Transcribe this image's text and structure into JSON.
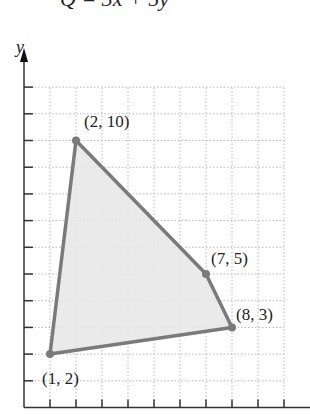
{
  "header": {
    "formula_cropped": "Q = 3x + 5y"
  },
  "chart_data": {
    "type": "polygon",
    "title": "",
    "xlabel": "",
    "ylabel": "y",
    "xlim": [
      0,
      10
    ],
    "ylim": [
      0,
      12
    ],
    "grid": true,
    "x_ticks": [
      1,
      2,
      3,
      4,
      5,
      6,
      7,
      8,
      9,
      10
    ],
    "y_ticks": [
      1,
      2,
      3,
      4,
      5,
      6,
      7,
      8,
      9,
      10,
      11,
      12
    ],
    "vertices": [
      {
        "x": 1,
        "y": 2,
        "label": "(1, 2)"
      },
      {
        "x": 2,
        "y": 10,
        "label": "(2, 10)"
      },
      {
        "x": 7,
        "y": 5,
        "label": "(7, 5)"
      },
      {
        "x": 8,
        "y": 3,
        "label": "(8, 3)"
      }
    ],
    "region_fill": "#e6e6e6",
    "edge_color": "#7a7a7a",
    "grid_color": "#b8b8b8",
    "axis_color": "#333333"
  }
}
